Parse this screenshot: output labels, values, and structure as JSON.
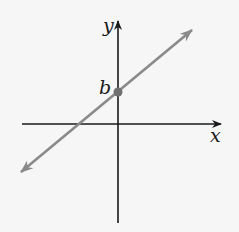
{
  "diagram": {
    "type": "coordinate-plane-line",
    "axes": {
      "x_label": "x",
      "y_label": "y"
    },
    "intercept": {
      "label": "b"
    },
    "colors": {
      "background": "#f6f6f6",
      "axis": "#1a1a1a",
      "line": "#8a8a8a",
      "point": "#707070"
    }
  }
}
